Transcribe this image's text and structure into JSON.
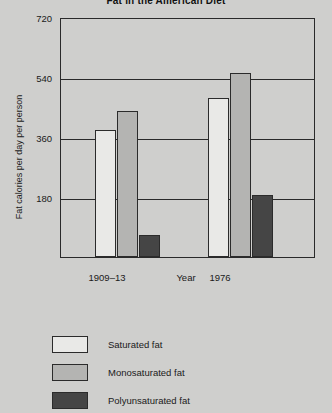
{
  "chart_data": {
    "type": "bar",
    "title": "Fat in the American Diet",
    "xlabel": "Year",
    "ylabel": "Fat calories per day per person",
    "categories": [
      "1909–13",
      "1976"
    ],
    "series": [
      {
        "name": "Saturated fat",
        "values": [
          381,
          477
        ],
        "color": "#e9e9e7"
      },
      {
        "name": "Monosaturated fat",
        "values": [
          438,
          552
        ],
        "color": "#b4b4b2"
      },
      {
        "name": "Polyunsaturated fat",
        "values": [
          66,
          186
        ],
        "color": "#454545"
      }
    ],
    "ylim": [
      0,
      800
    ],
    "yticks": [
      720,
      540,
      360,
      180
    ],
    "grid": true,
    "legend_position": "bottom-left"
  },
  "axis": {
    "y_ticks": [
      {
        "label": "720"
      },
      {
        "label": "540"
      },
      {
        "label": "360"
      },
      {
        "label": "180"
      }
    ]
  },
  "legend": {
    "items": [
      {
        "label": "Saturated fat"
      },
      {
        "label": "Monosaturated fat"
      },
      {
        "label": "Polyunsaturated fat"
      }
    ]
  }
}
